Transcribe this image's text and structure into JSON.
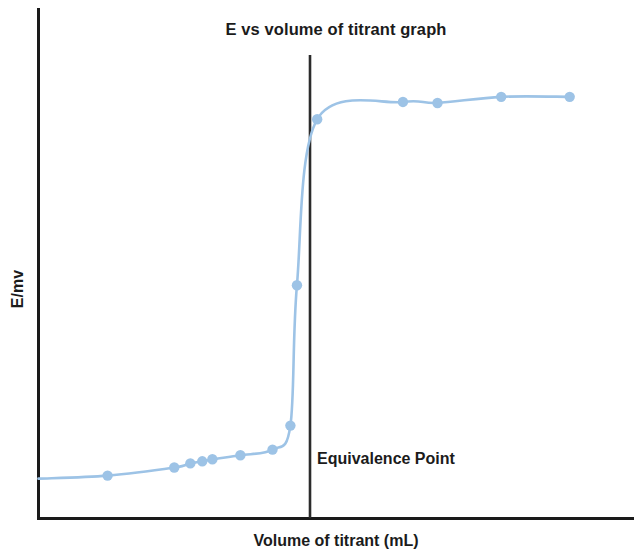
{
  "chart_data": {
    "type": "line",
    "title": "E vs volume of titrant graph",
    "xlabel": "Volume of titrant (mL)",
    "ylabel": "E/mv",
    "grid": false,
    "legend": "none",
    "axis_ticks_visible": false,
    "xlim": [
      0,
      100
    ],
    "ylim": [
      0,
      100
    ],
    "series": [
      {
        "name": "E vs volume of titrant",
        "marker": "circle",
        "color": "#9DC3E6",
        "line_color": "#9DC3E6",
        "x": [
          11.6,
          22.8,
          25.5,
          27.5,
          29.2,
          33.9,
          39.3,
          42.3,
          43.4,
          46.8,
          61.2,
          67.0,
          77.7,
          89.2
        ],
        "y": [
          8.4,
          10.0,
          10.8,
          11.2,
          11.6,
          12.4,
          13.5,
          18.2,
          45.7,
          78.2,
          81.6,
          81.4,
          82.6,
          82.6
        ]
      }
    ],
    "annotations": [
      {
        "type": "vertical-line",
        "label": "Equivalence Point",
        "x": 45.6,
        "color": "#2b2b2b"
      }
    ]
  },
  "axes": {
    "frame_color": "#1a1a1a",
    "left_axis": true,
    "bottom_axis": true,
    "top_axis": false,
    "right_axis": false
  }
}
